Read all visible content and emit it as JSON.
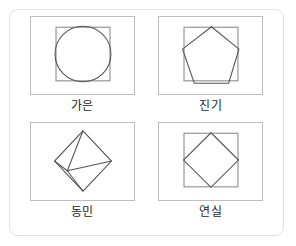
{
  "card": {
    "border_color": "#e2e2e2",
    "background": "#ffffff"
  },
  "colors": {
    "frame_stroke": "#bdbdbd",
    "inner_square_stroke": "#8a8a8a",
    "figure_stroke": "#555555",
    "label_text": "#1d1d1d"
  },
  "panels": [
    {
      "id": "panel-circle",
      "label": "가은",
      "figure_name": "circle-in-square",
      "figure_description": "원이 정사각형 안에 내접하며 아래쪽으로 약간 벗어남"
    },
    {
      "id": "panel-pentagon",
      "label": "진기",
      "figure_name": "pentagon-in-square",
      "figure_description": "오각형이 정사각형 안에 그려지고 좌우 아래 꼭짓점이 약간 벗어남"
    },
    {
      "id": "panel-tetrahedron",
      "label": "동민",
      "figure_name": "tetrahedron-wireframe",
      "figure_description": "마름모 형태의 사면체 입체 선 그림"
    },
    {
      "id": "panel-diamond",
      "label": "연실",
      "figure_name": "diamond-in-square",
      "figure_description": "마름모가 정사각형 변의 중점에 내접"
    }
  ]
}
